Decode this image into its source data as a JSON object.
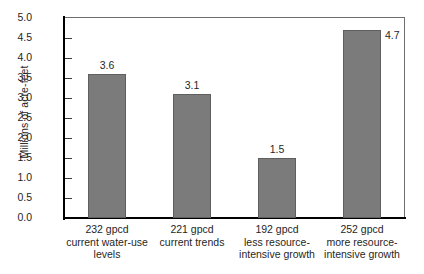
{
  "chart_data": {
    "type": "bar",
    "title": "",
    "xlabel": "",
    "ylabel": "Millions of acre-feet",
    "ylim": [
      0.0,
      5.0
    ],
    "ytick_step": 0.5,
    "grid": false,
    "legend": "none",
    "bar_color": "#7b7b7b",
    "bar_edge_color": "#5f5f5f",
    "categories": [
      "232 gpcd current water-use levels",
      "221 gpcd current trends",
      "192 gpcd less resource-intensive growth",
      "252 gpcd more resource-intensive growth"
    ],
    "category_lines": [
      [
        "232 gpcd",
        "current water-use",
        "levels"
      ],
      [
        "221 gpcd",
        "current trends"
      ],
      [
        "192 gpcd",
        "less resource-",
        "intensive growth"
      ],
      [
        "252 gpcd",
        "more resource-",
        "intensive growth"
      ]
    ],
    "values": [
      3.6,
      3.1,
      1.5,
      4.7
    ],
    "value_labels": [
      "3.6",
      "3.1",
      "1.5",
      "4.7"
    ],
    "yticks": [
      "0.0",
      "0.5",
      "1.0",
      "1.5",
      "2.0",
      "2.5",
      "3.0",
      "3.5",
      "4.0",
      "4.5",
      "5.0"
    ]
  }
}
